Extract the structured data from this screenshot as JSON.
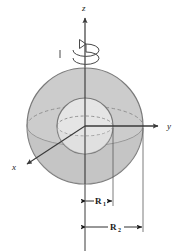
{
  "figure": {
    "background_color": "#ffffff"
  },
  "axes": {
    "z": {
      "label": "z",
      "direction": "up",
      "x": 85,
      "tip_y": 14
    },
    "y": {
      "label": "y",
      "direction": "right",
      "y": 126,
      "tip_x": 163
    },
    "x": {
      "label": "x",
      "direction": "down-left",
      "tip_x": 22,
      "tip_y": 160
    },
    "origin": {
      "x": 85,
      "y": 126
    },
    "color": "#3a3a3a"
  },
  "rotation": {
    "name": "spin-arrow",
    "description": "curved elliptical arrow around z-axis indicating rotation",
    "center_x": 85,
    "center_y": 52,
    "color": "#4a4a4a"
  },
  "outer_sphere": {
    "name": "outer-sphere",
    "center_x": 85,
    "center_y": 126,
    "radius": 58,
    "fill": "#c9c9c9",
    "stroke": "#7a7a7a",
    "equator_style": "front-solid-back-dashed"
  },
  "inner_sphere": {
    "name": "inner-sphere",
    "center_x": 85,
    "center_y": 126,
    "radius": 28,
    "fill": "#e6e6e6",
    "stroke": "#7a7a7a",
    "equator_style": "front-solid-back-dashed"
  },
  "dimensions": [
    {
      "name": "inner-radius-dimension",
      "label": "R",
      "subscript": "1",
      "from_x": 85,
      "to_x": 113,
      "line_y": 201,
      "extension_top_y": 128,
      "text_x": 99,
      "text_y": 204
    },
    {
      "name": "outer-radius-dimension",
      "label": "R",
      "subscript": "2",
      "from_x": 85,
      "to_x": 143,
      "line_y": 227,
      "extension_top_y": 128,
      "text_x": 114,
      "text_y": 230
    }
  ],
  "colors": {
    "outer_fill": "#c9c9c9",
    "inner_fill": "#e6e6e6",
    "outline": "#7a7a7a",
    "axis": "#3a3a3a",
    "text": "#1a1a1a",
    "dashed": "#8a8a8a"
  }
}
